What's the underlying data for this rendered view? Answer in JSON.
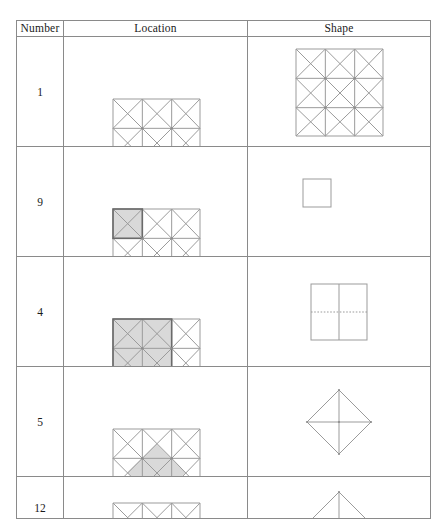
{
  "page": {
    "background_color": "#ffffff",
    "ink_color": "#9b9b9b",
    "shade_color": "#d2d2d2",
    "highlight_color": "#6a6a6a"
  },
  "table": {
    "headers": [
      {
        "key": "number",
        "label": "Number"
      },
      {
        "key": "location",
        "label": "Location"
      },
      {
        "key": "shape",
        "label": "Shape"
      }
    ],
    "rows": [
      {
        "number": "1",
        "location": {
          "icon": "grid-3x3-with-diagonals",
          "grid_size": 3,
          "shaded_cells": [],
          "shaded_region": "none"
        },
        "shape": {
          "icon": "grid-3x3-with-diagonals",
          "grid_size": 3,
          "description": "full 3 by 3 grid with both diagonals in every cell"
        }
      },
      {
        "number": "9",
        "location": {
          "icon": "grid-3x3-with-diagonals",
          "grid_size": 3,
          "shaded_cells": [
            [
              0,
              0
            ]
          ],
          "shaded_region": "single top-left cell"
        },
        "shape": {
          "icon": "square-outline",
          "description": "small empty square"
        }
      },
      {
        "number": "4",
        "location": {
          "icon": "grid-3x3-with-diagonals",
          "grid_size": 3,
          "shaded_cells": [
            [
              0,
              0
            ],
            [
              0,
              1
            ],
            [
              1,
              0
            ],
            [
              1,
              1
            ]
          ],
          "shaded_region": "top-left 2 by 2 block"
        },
        "shape": {
          "icon": "square-split-vertical-solid-horizontal-dotted",
          "description": "square with solid vertical midline and dotted horizontal midline"
        }
      },
      {
        "number": "5",
        "location": {
          "icon": "grid-3x3-with-diagonals",
          "grid_size": 3,
          "shaded_cells": [],
          "shaded_region": "central diamond spanning the middle cell edge midpoints"
        },
        "shape": {
          "icon": "diamond-quartered",
          "description": "diamond divided into four smaller diamonds"
        }
      },
      {
        "number": "12",
        "location": {
          "icon": "grid-3x3-with-diagonals",
          "grid_size": 3,
          "shaded_cells": [],
          "shaded_region": "none visible",
          "clipped": "true"
        },
        "shape": {
          "icon": "diamond-quartered",
          "description": "top apex of a diamond, cut off by page edge",
          "clipped": "true"
        }
      }
    ]
  }
}
